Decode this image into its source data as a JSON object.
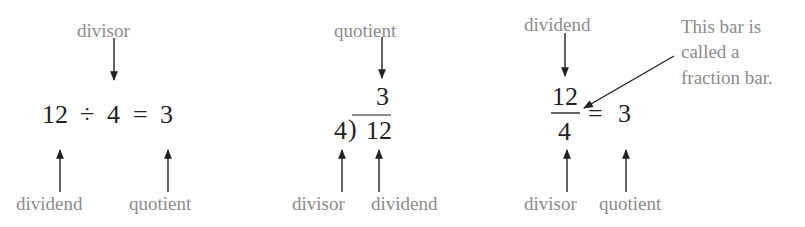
{
  "panels": [
    {
      "form": "division-sign",
      "expression": {
        "dividend": "12",
        "operator": "÷",
        "divisor": "4",
        "equals": "=",
        "quotient": "3"
      },
      "labels": {
        "top": "divisor",
        "bottom_left": "dividend",
        "bottom_right": "quotient"
      }
    },
    {
      "form": "long-division",
      "expression": {
        "quotient": "3",
        "divisor": "4",
        "bracket": ")",
        "dividend": "12"
      },
      "labels": {
        "top": "quotient",
        "bottom_left": "divisor",
        "bottom_right": "dividend"
      }
    },
    {
      "form": "fraction",
      "expression": {
        "numerator": "12",
        "denominator": "4",
        "equals": "=",
        "quotient": "3"
      },
      "labels": {
        "top": "dividend",
        "bottom_left": "divisor",
        "bottom_right": "quotient"
      },
      "callout": {
        "line1": "This bar is",
        "line2": "called a",
        "line3": "fraction bar."
      }
    }
  ],
  "colors": {
    "label": "#8c8c8c",
    "math": "#222222",
    "arrow": "#222222"
  }
}
